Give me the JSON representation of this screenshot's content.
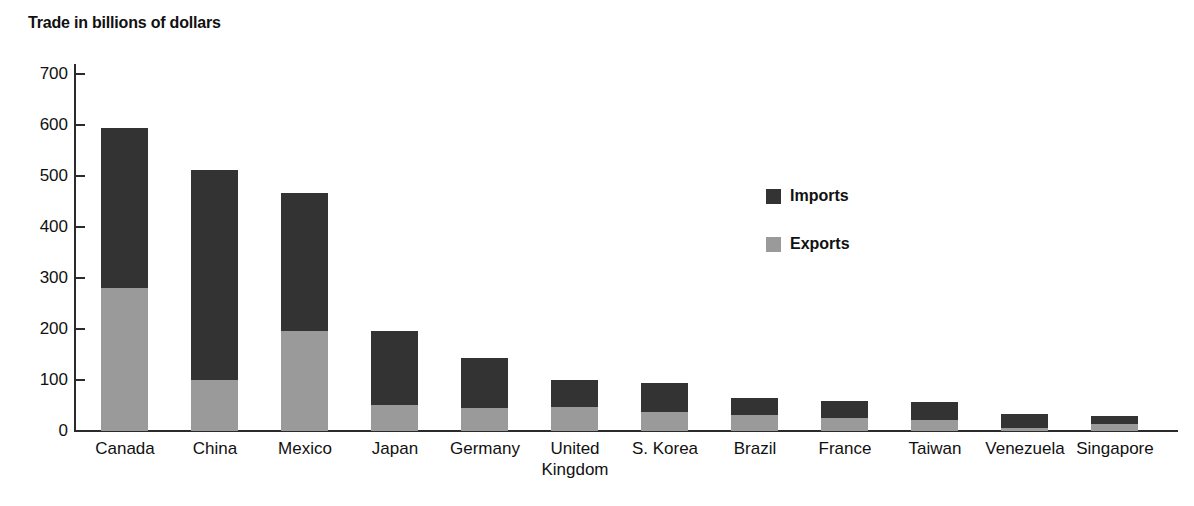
{
  "chart_data": {
    "type": "bar",
    "subtype": "stacked-vertical",
    "title": "Trade in billions of dollars",
    "xlabel": "",
    "ylabel": "",
    "ylim": [
      0,
      700
    ],
    "yticks": [
      0,
      100,
      200,
      300,
      400,
      500,
      600,
      700
    ],
    "ytick_labels": [
      "0",
      "100",
      "200",
      "300",
      "400",
      "500",
      "600",
      "700"
    ],
    "grid": false,
    "legend_position": "inside-upper-right",
    "categories": [
      "Canada",
      "China",
      "Mexico",
      "Japan",
      "Germany",
      "United Kingdom",
      "S. Korea",
      "Brazil",
      "France",
      "Taiwan",
      "Venezuela",
      "Singapore"
    ],
    "series": [
      {
        "name": "Exports",
        "color": "#9a9a9a",
        "values": [
          280,
          100,
          196,
          51,
          45,
          47,
          37,
          31,
          25,
          22,
          6,
          14
        ]
      },
      {
        "name": "Imports",
        "color": "#333333",
        "values": [
          315,
          412,
          271,
          145,
          98,
          53,
          57,
          34,
          34,
          35,
          27,
          16
        ]
      }
    ],
    "totals": [
      595,
      512,
      467,
      196,
      143,
      100,
      94,
      65,
      59,
      57,
      33,
      30
    ]
  },
  "title": {
    "text": "Trade in billions of dollars"
  },
  "axis": {
    "y_ticks": [
      {
        "label": "700",
        "value": 700
      },
      {
        "label": "600",
        "value": 600
      },
      {
        "label": "500",
        "value": 500
      },
      {
        "label": "400",
        "value": 400
      },
      {
        "label": "300",
        "value": 300
      },
      {
        "label": "200",
        "value": 200
      },
      {
        "label": "100",
        "value": 100
      },
      {
        "label": "0",
        "value": 0
      }
    ],
    "categories": [
      {
        "label": "Canada",
        "line1": "Canada",
        "line2": ""
      },
      {
        "label": "China",
        "line1": "China",
        "line2": ""
      },
      {
        "label": "Mexico",
        "line1": "Mexico",
        "line2": ""
      },
      {
        "label": "Japan",
        "line1": "Japan",
        "line2": ""
      },
      {
        "label": "Germany",
        "line1": "Germany",
        "line2": ""
      },
      {
        "label": "United Kingdom",
        "line1": "United",
        "line2": "Kingdom"
      },
      {
        "label": "S. Korea",
        "line1": "S. Korea",
        "line2": ""
      },
      {
        "label": "Brazil",
        "line1": "Brazil",
        "line2": ""
      },
      {
        "label": "France",
        "line1": "France",
        "line2": ""
      },
      {
        "label": "Taiwan",
        "line1": "Taiwan",
        "line2": ""
      },
      {
        "label": "Venezuela",
        "line1": "Venezuela",
        "line2": ""
      },
      {
        "label": "Singapore",
        "line1": "Singapore",
        "line2": ""
      }
    ]
  },
  "legend": {
    "items": [
      {
        "label": "Imports",
        "color": "#333333"
      },
      {
        "label": "Exports",
        "color": "#9a9a9a"
      }
    ]
  },
  "colors": {
    "imports": "#333333",
    "exports": "#9a9a9a",
    "axis": "#2b2b2b",
    "text": "#111111",
    "background": "#ffffff"
  }
}
